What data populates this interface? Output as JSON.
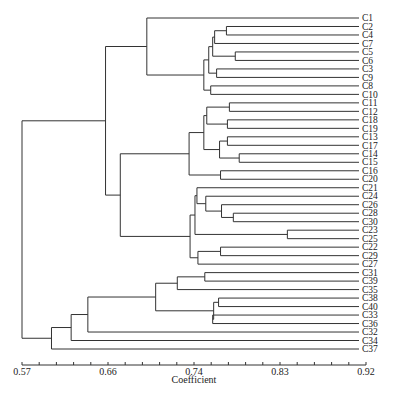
{
  "chart_data": {
    "type": "dendrogram",
    "title": "",
    "xlabel": "Coefficient",
    "ylabel": "",
    "xlim": [
      0.57,
      0.92
    ],
    "xticks": [
      "0.57",
      "0.66",
      "0.74",
      "0.83",
      "0.92"
    ],
    "minor_tick_step": 0.0175,
    "leaves": [
      "C1",
      "C2",
      "C4",
      "C7",
      "C5",
      "C6",
      "C3",
      "C9",
      "C8",
      "C10",
      "C11",
      "C12",
      "C18",
      "C19",
      "C13",
      "C17",
      "C14",
      "C15",
      "C16",
      "C20",
      "C21",
      "C24",
      "C26",
      "C28",
      "C30",
      "C23",
      "C25",
      "C22",
      "C29",
      "C27",
      "C31",
      "C39",
      "C35",
      "C38",
      "C40",
      "C33",
      "C36",
      "C32",
      "C34",
      "C37"
    ],
    "tree": {
      "h": 0.57,
      "c": [
        {
          "h": 0.655,
          "c": [
            {
              "h": 0.697,
              "c": [
                "C1",
                {
                  "h": 0.755,
                  "c": [
                    {
                      "h": 0.76,
                      "c": [
                        {
                          "h": 0.764,
                          "c": [
                            {
                              "h": 0.766,
                              "c": [
                                {
                                  "h": 0.778,
                                  "c": [
                                    "C2",
                                    "C4"
                                  ]
                                },
                                "C7"
                              ]
                            },
                            {
                              "h": 0.787,
                              "c": [
                                "C5",
                                "C6"
                              ]
                            }
                          ]
                        },
                        {
                          "h": 0.768,
                          "c": [
                            "C3",
                            "C9"
                          ]
                        }
                      ]
                    },
                    {
                      "h": 0.762,
                      "c": [
                        "C8",
                        "C10"
                      ]
                    }
                  ]
                }
              ]
            },
            {
              "h": 0.67,
              "c": [
                {
                  "h": 0.74,
                  "c": [
                    {
                      "h": 0.755,
                      "c": [
                        {
                          "h": 0.758,
                          "c": [
                            {
                              "h": 0.781,
                              "c": [
                                "C11",
                                "C12"
                              ]
                            },
                            {
                              "h": 0.779,
                              "c": [
                                "C18",
                                "C19"
                              ]
                            }
                          ]
                        },
                        {
                          "h": 0.771,
                          "c": [
                            {
                              "h": 0.779,
                              "c": [
                                "C13",
                                "C17"
                              ]
                            },
                            {
                              "h": 0.791,
                              "c": [
                                "C14",
                                "C15"
                              ]
                            }
                          ]
                        }
                      ]
                    },
                    {
                      "h": 0.772,
                      "c": [
                        "C16",
                        "C20"
                      ]
                    }
                  ]
                },
                {
                  "h": 0.741,
                  "c": [
                    {
                      "h": 0.746,
                      "c": [
                        {
                          "h": 0.748,
                          "c": [
                            "C21",
                            {
                              "h": 0.757,
                              "c": [
                                "C24",
                                {
                                  "h": 0.773,
                                  "c": [
                                    "C26",
                                    {
                                      "h": 0.785,
                                      "c": [
                                        "C28",
                                        "C30"
                                      ]
                                    }
                                  ]
                                }
                              ]
                            }
                          ]
                        },
                        {
                          "h": 0.84,
                          "c": [
                            "C23",
                            "C25"
                          ]
                        }
                      ]
                    },
                    {
                      "h": 0.749,
                      "c": [
                        {
                          "h": 0.772,
                          "c": [
                            "C22",
                            "C29"
                          ]
                        },
                        "C27"
                      ]
                    }
                  ]
                }
              ]
            }
          ]
        },
        {
          "h": 0.6,
          "c": [
            {
              "h": 0.62,
              "c": [
                {
                  "h": 0.637,
                  "c": [
                    {
                      "h": 0.706,
                      "c": [
                        {
                          "h": 0.728,
                          "c": [
                            {
                              "h": 0.756,
                              "c": [
                                "C31",
                                "C39"
                              ]
                            },
                            "C35"
                          ]
                        },
                        {
                          "h": 0.765,
                          "c": [
                            {
                              "h": 0.77,
                              "c": [
                                "C38",
                                "C40"
                              ]
                            },
                            {
                              "h": 0.764,
                              "c": [
                                "C33",
                                "C36"
                              ]
                            }
                          ]
                        }
                      ]
                    },
                    "C32"
                  ]
                },
                "C34"
              ]
            },
            "C37"
          ]
        }
      ]
    }
  }
}
